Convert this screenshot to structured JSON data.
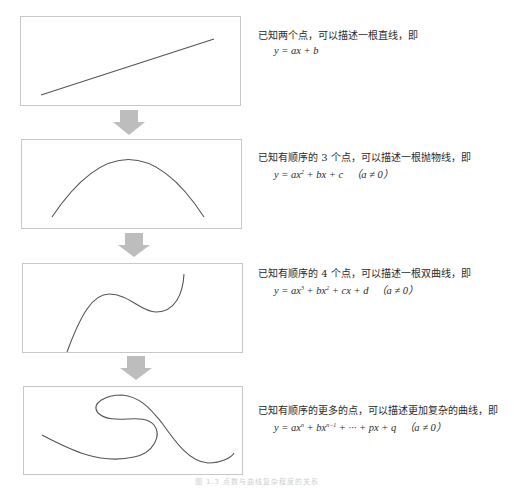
{
  "stages": [
    {
      "description": "已知两个点，可以描述一根直线，即",
      "formula": "y = ax + b",
      "condition": "",
      "curve": "straight-line"
    },
    {
      "description": "已知有顺序的 3 个点，可以描述一根抛物线，即",
      "formula_parts": [
        "y = ax",
        "2",
        " + bx + c"
      ],
      "condition": "（a ≠ 0）",
      "curve": "parabola"
    },
    {
      "description": "已知有顺序的 4 个点，可以描述一根双曲线，即",
      "formula_parts": [
        "y = ax",
        "3",
        " + bx",
        "2",
        " + cx + d"
      ],
      "condition": "（a ≠ 0）",
      "curve": "cubic"
    },
    {
      "description": "已知有顺序的更多的点，可以描述更加复杂的曲线，即",
      "formula_parts": [
        "y = ax",
        "n",
        " + bx",
        "n−1",
        " + ··· + px + q"
      ],
      "condition": "（a ≠ 0）",
      "curve": "complex-loop"
    }
  ],
  "arrows": {
    "count": 3,
    "color": "#bdbdbd"
  },
  "caption": "图 1.3  点数与曲线复杂程度的关系",
  "colors": {
    "panel_border": "#c8c8c8",
    "curve": "#555555",
    "arrow": "#bdbdbd"
  }
}
